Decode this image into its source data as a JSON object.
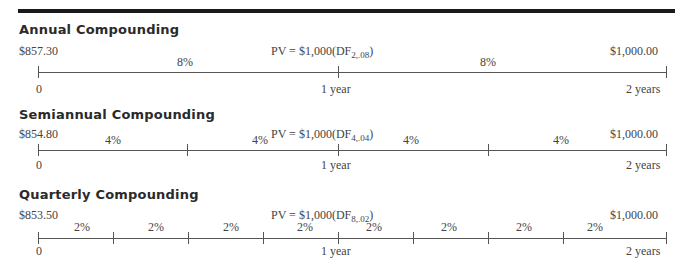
{
  "sections": [
    {
      "heading": "Annual Compounding",
      "pv": "$857.30",
      "formula_prefix": "PV = $1,000(DF",
      "formula_sub": "2,.08",
      "formula_suffix": ")",
      "fv": "$1,000.00",
      "start_label": "0",
      "mid_label": "1 year",
      "end_label": "2 years",
      "periods": 2,
      "rates": [
        "8%",
        "8%"
      ]
    },
    {
      "heading": "Semiannual Compounding",
      "pv": "$854.80",
      "formula_prefix": "PV = $1,000(DF",
      "formula_sub": "4,.04",
      "formula_suffix": ")",
      "fv": "$1,000.00",
      "start_label": "0",
      "mid_label": "1 year",
      "end_label": "2 years",
      "periods": 4,
      "rates": [
        "4%",
        "4%",
        "4%",
        "4%"
      ]
    },
    {
      "heading": "Quarterly Compounding",
      "pv": "$853.50",
      "formula_prefix": "PV = $1,000(DF",
      "formula_sub": "8,.02",
      "formula_suffix": ")",
      "fv": "$1,000.00",
      "start_label": "0",
      "mid_label": "1 year",
      "end_label": "2 years",
      "periods": 8,
      "rates": [
        "2%",
        "2%",
        "2%",
        "2%",
        "2%",
        "2%",
        "2%",
        "2%"
      ]
    }
  ]
}
